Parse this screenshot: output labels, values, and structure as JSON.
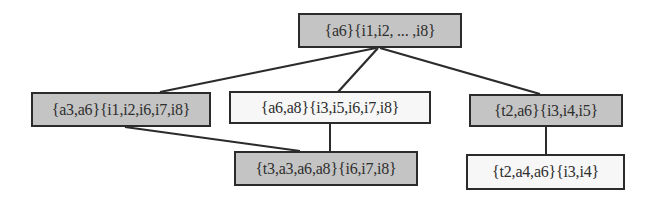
{
  "diagram": {
    "type": "lattice-tree",
    "colors": {
      "shaded_fill": "#c4c4c4",
      "plain_fill": "#f7f7f7",
      "border": "#2b2b2b",
      "edge": "#2b2b2b"
    },
    "nodes": [
      {
        "id": "root",
        "label": "{a6}{i1,i2, ... ,i8}",
        "shaded": true
      },
      {
        "id": "n_a3a6",
        "label": "{a3,a6}{i1,i2,i6,i7,i8}",
        "shaded": true
      },
      {
        "id": "n_a6a8",
        "label": "{a6,a8}{i3,i5,i6,i7,i8}",
        "shaded": false
      },
      {
        "id": "n_t2a6",
        "label": "{t2,a6}{i3,i4,i5}",
        "shaded": true
      },
      {
        "id": "n_t3a3a6a8",
        "label": "{t3,a3,a6,a8}{i6,i7,i8}",
        "shaded": true
      },
      {
        "id": "n_t2a4a6",
        "label": "{t2,a4,a6}{i3,i4}",
        "shaded": false
      }
    ],
    "edges": [
      {
        "from": "root",
        "to": "n_a3a6"
      },
      {
        "from": "root",
        "to": "n_a6a8"
      },
      {
        "from": "root",
        "to": "n_t2a6"
      },
      {
        "from": "n_a3a6",
        "to": "n_t3a3a6a8"
      },
      {
        "from": "n_a6a8",
        "to": "n_t3a3a6a8"
      },
      {
        "from": "n_t2a6",
        "to": "n_t2a4a6"
      }
    ]
  }
}
